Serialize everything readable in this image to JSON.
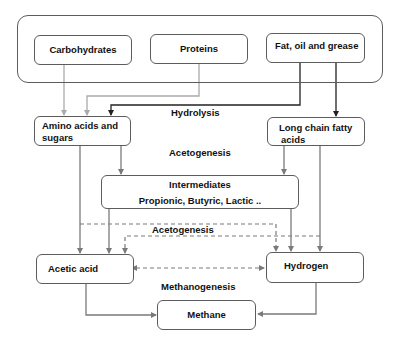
{
  "diagram": {
    "nodes": {
      "carbohydrates": "Carbohydrates",
      "proteins": "Proteins",
      "fats": "Fat, oil and grease",
      "amino_sugars": "Amino acids and sugars",
      "amino_sugars_line1": "Amino acids and",
      "amino_sugars_line2": "sugars",
      "lcfa": "Long chain fatty acids",
      "lcfa_line1": "Long chain fatty",
      "lcfa_line2": "acids",
      "intermediates_title": "Intermediates",
      "intermediates_sub": "Propionic, Butyric, Lactic ..",
      "acetic_acid": "Acetic acid",
      "hydrogen": "Hydrogen",
      "methane": "Methane"
    },
    "stages": {
      "hydrolysis": "Hydrolysis",
      "acetogenesis_1": "Acetogenesis",
      "acetogenesis_2": "Acetogenesis",
      "methanogenesis": "Methanogenesis"
    },
    "edges": [
      {
        "from": "Carbohydrates",
        "to": "Amino acids and sugars",
        "style": "solid-light"
      },
      {
        "from": "Proteins",
        "to": "Amino acids and sugars",
        "style": "solid-light"
      },
      {
        "from": "Fat, oil and grease",
        "to": "Amino acids and sugars",
        "style": "solid-dark"
      },
      {
        "from": "Fat, oil and grease",
        "to": "Long chain fatty acids",
        "style": "solid-dark"
      },
      {
        "from": "Amino acids and sugars",
        "to": "Intermediates",
        "style": "solid"
      },
      {
        "from": "Amino acids and sugars",
        "to": "Acetic acid",
        "style": "solid"
      },
      {
        "from": "Long chain fatty acids",
        "to": "Intermediates",
        "style": "solid"
      },
      {
        "from": "Long chain fatty acids",
        "to": "Hydrogen",
        "style": "solid"
      },
      {
        "from": "Intermediates",
        "to": "Acetic acid",
        "style": "solid"
      },
      {
        "from": "Intermediates",
        "to": "Hydrogen",
        "style": "solid"
      },
      {
        "from": "Amino acids and sugars",
        "to": "Hydrogen",
        "style": "dashed"
      },
      {
        "from": "Long chain fatty acids",
        "to": "Acetic acid",
        "style": "dashed"
      },
      {
        "from": "Acetic acid",
        "to": "Hydrogen",
        "style": "dashed-bidirectional"
      },
      {
        "from": "Acetic acid",
        "to": "Methane",
        "style": "solid"
      },
      {
        "from": "Hydrogen",
        "to": "Methane",
        "style": "solid"
      }
    ],
    "colors": {
      "border": "#5c5c5c",
      "arrow": "#7a7a7a",
      "arrow_light": "#aaaaaa",
      "arrow_dark": "#222222",
      "text": "#111111"
    }
  }
}
